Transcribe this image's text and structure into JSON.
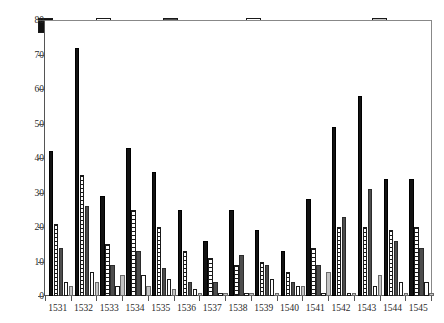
{
  "chart_data": {
    "type": "bar",
    "title": "",
    "xlabel": "",
    "ylabel": "",
    "ylim": [
      0,
      80
    ],
    "yticks": [
      0,
      10,
      20,
      30,
      40,
      50,
      60,
      70,
      80
    ],
    "grid": false,
    "legend_position": "top",
    "categories": [
      "1531",
      "1532",
      "1533",
      "1534",
      "1535",
      "1536",
      "1537",
      "1538",
      "1539",
      "1540",
      "1541",
      "1542",
      "1543",
      "1544",
      "1545"
    ],
    "series": [
      {
        "name": "Total",
        "color": "#121212",
        "values": [
          42,
          72,
          29,
          43,
          36,
          25,
          16,
          25,
          19,
          13,
          28,
          49,
          58,
          34,
          34
        ]
      },
      {
        "name": "Leases",
        "color": "#ffffff",
        "values": [
          21,
          35,
          15,
          25,
          20,
          13,
          11,
          9,
          10,
          7,
          14,
          20,
          20,
          19,
          20
        ]
      },
      {
        "name": "Residence",
        "color": "#4d4d4d",
        "values": [
          14,
          26,
          9,
          13,
          8,
          4,
          4,
          12,
          9,
          4,
          9,
          23,
          31,
          16,
          14
        ]
      },
      {
        "name": "Buying and Selling",
        "color": "#ffffff",
        "values": [
          4,
          7,
          3,
          6,
          5,
          2,
          1,
          1,
          5,
          3,
          1,
          1,
          3,
          4,
          4
        ]
      },
      {
        "name": "Other",
        "color": "#c4c4c4",
        "values": [
          3,
          4,
          6,
          3,
          2,
          1,
          1,
          1,
          1,
          3,
          7,
          1,
          6,
          1,
          1
        ]
      }
    ]
  },
  "legend": {
    "items": [
      {
        "label": "Total"
      },
      {
        "label": "Leases"
      },
      {
        "label": "Residence"
      },
      {
        "label": "Buying and Selling"
      },
      {
        "label": "Other"
      }
    ]
  }
}
